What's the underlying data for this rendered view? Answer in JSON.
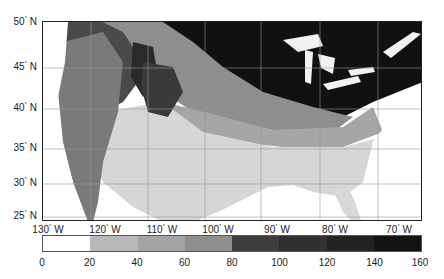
{
  "map": {
    "type": "choropleth-raster",
    "region": "Contiguous United States",
    "lat_labels": [
      {
        "deg": "50",
        "hem": "N",
        "y": 22
      },
      {
        "deg": "45",
        "hem": "N",
        "y": 67
      },
      {
        "deg": "40",
        "hem": "N",
        "y": 108
      },
      {
        "deg": "35",
        "hem": "N",
        "y": 148
      },
      {
        "deg": "30",
        "hem": "N",
        "y": 183
      },
      {
        "deg": "25",
        "hem": "N",
        "y": 216
      }
    ],
    "lon_labels": [
      {
        "deg": "130",
        "hem": "W",
        "x": 48
      },
      {
        "deg": "120",
        "hem": "W",
        "x": 105
      },
      {
        "deg": "110",
        "hem": "W",
        "x": 162
      },
      {
        "deg": "100",
        "hem": "W",
        "x": 218
      },
      {
        "deg": "90",
        "hem": "W",
        "x": 277
      },
      {
        "deg": "80",
        "hem": "W",
        "x": 335
      },
      {
        "deg": "70",
        "hem": "W",
        "x": 399
      }
    ],
    "degree_symbol": "°"
  },
  "colorbar": {
    "ticks": [
      "0",
      "20",
      "40",
      "60",
      "80",
      "100",
      "120",
      "140",
      "160"
    ],
    "colors": [
      "#ffffff",
      "#b8b8b8",
      "#a4a4a4",
      "#8e8e8e",
      "#3e3e3e",
      "#303030",
      "#222222",
      "#121212"
    ]
  }
}
